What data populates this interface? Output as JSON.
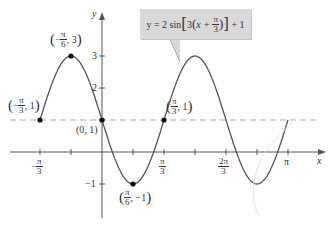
{
  "chart_data": {
    "type": "line",
    "title": "",
    "equation": "y = 2 sin[3(x + π/3)] + 1",
    "xlabel": "x",
    "ylabel": "y",
    "xlim": [
      -1.2,
      3.3
    ],
    "ylim": [
      -1.5,
      3.6
    ],
    "grid": false,
    "legend": "none",
    "x_ticks": [
      {
        "value": -1.0472,
        "label": "-π/3"
      },
      {
        "value": -0.5236,
        "label": ""
      },
      {
        "value": 0.5236,
        "label": ""
      },
      {
        "value": 1.0472,
        "label": "π/3"
      },
      {
        "value": 1.5708,
        "label": ""
      },
      {
        "value": 2.0944,
        "label": "2π/3"
      },
      {
        "value": 2.618,
        "label": ""
      },
      {
        "value": 3.1416,
        "label": "π"
      }
    ],
    "y_ticks": [
      {
        "value": 3,
        "label": "3"
      },
      {
        "value": 2,
        "label": "2"
      },
      {
        "value": 1,
        "label": ""
      },
      {
        "value": -1,
        "label": "-1"
      }
    ],
    "reference_line": {
      "y": 1,
      "style": "dashed",
      "color": "#aaaaaa"
    },
    "series": [
      {
        "name": "y = 2 sin[3(x + π/3)] + 1",
        "color": "#555555",
        "function": "2*sin(3*(x+pi/3))+1",
        "domain": [
          -1.0472,
          3.1416
        ],
        "x": [
          -1.0472,
          -0.7854,
          -0.5236,
          -0.2618,
          0,
          0.2618,
          0.5236,
          0.7854,
          1.0472,
          1.309,
          1.5708,
          1.8326,
          2.0944,
          2.3562,
          2.618,
          2.8798,
          3.1416
        ],
        "values": [
          1,
          2.414,
          3,
          2.414,
          1,
          -0.414,
          -1,
          -0.414,
          1,
          2.414,
          3,
          2.414,
          1,
          -0.414,
          -1,
          -0.414,
          1
        ]
      }
    ],
    "annotations": [
      {
        "x": -1.0472,
        "y": 1,
        "label": "(-π/3, 1)"
      },
      {
        "x": -0.5236,
        "y": 3,
        "label": "(-π/6, 3)"
      },
      {
        "x": 0,
        "y": 1,
        "label": "(0, 1)"
      },
      {
        "x": 0.5236,
        "y": -1,
        "label": "(π/6, -1)"
      },
      {
        "x": 1.0472,
        "y": 1,
        "label": "(π/3, 1)"
      }
    ]
  },
  "labels": {
    "y_axis": "y",
    "x_axis": "x",
    "tick_3": "3",
    "tick_2": "2",
    "tick_neg1": "−1",
    "pi": "π",
    "three": "3",
    "six": "6",
    "two_pi": "2π",
    "minus": "−",
    "pt_origin": "(0, 1)",
    "pt_val_1": "1",
    "pt_val_3": "3",
    "pt_val_neg1": "−1",
    "callout": {
      "y_eq": "y = 2 sin",
      "three": "3",
      "x_plus": "x +",
      "plus_one": "+ 1"
    }
  },
  "colors": {
    "curve": "#555555",
    "axis": "#555555",
    "dashed": "#aaaaaa",
    "callout_bg": "#d9d9d9",
    "point": "#111111"
  }
}
